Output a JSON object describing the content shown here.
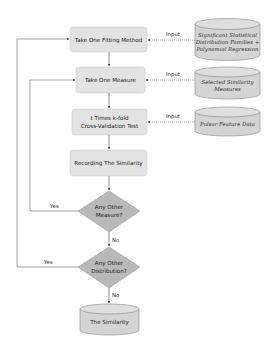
{
  "diagram": {
    "process": {
      "fitting": "Take One Fitting Method",
      "measure": "Take One Measure",
      "cv_line1": "t Times k-fold",
      "cv_line2": "Cross-Validation Test",
      "record": "Recording The Similarity"
    },
    "decisions": {
      "measure_line1": "Any Other",
      "measure_line2": "Measure?",
      "dist_line1": "Any Other",
      "dist_line2": "Distribution?"
    },
    "inputs": {
      "fam_line1": "Significant Statistical",
      "fam_line2": "Distribution Families +",
      "fam_line3": "Polynomial Regression",
      "sim_line1": "Selected Similarity",
      "sim_line2": "Measures",
      "pulsar": "Pulsar Feature Data"
    },
    "output": "The Similarity",
    "labels": {
      "input": "Input",
      "yes": "Yes",
      "no": "No"
    },
    "colors": {
      "box_fill": "#e3e3e3",
      "diamond_fill": "#b9b9b9",
      "cylinder_fill": "#d4d4d4",
      "line": "#555555"
    }
  }
}
